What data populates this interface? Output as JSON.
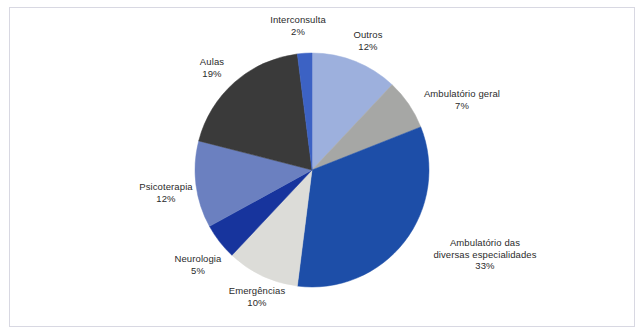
{
  "figure": {
    "background_color": "#ffffff",
    "frame_color": "#d8d8e2",
    "label_color": "#2b2b2b"
  },
  "chart_data": {
    "type": "pie",
    "title": "",
    "subtitle": "",
    "xlabel": "",
    "ylabel": "",
    "legend_position": "none",
    "labels_position": "outside",
    "grid": false,
    "start_angle_deg": 0,
    "direction": "clockwise",
    "categories": [
      "Outros",
      "Ambulatório geral",
      "Ambulatório das diversas especialidades",
      "Emergências",
      "Neurologia",
      "Psicoterapia",
      "Aulas",
      "Interconsulta"
    ],
    "values": [
      12,
      7,
      33,
      10,
      5,
      12,
      19,
      2
    ],
    "value_labels": [
      "12%",
      "7%",
      "33%",
      "10%",
      "5%",
      "12%",
      "19%",
      "2%"
    ],
    "colors": [
      "#9db0dd",
      "#a6a7a5",
      "#1d4ea8",
      "#dcdcd8",
      "#17349d",
      "#6b80c0",
      "#3a3a3a",
      "#3c62c4"
    ],
    "total": 100,
    "units": "percent"
  },
  "slices": [
    {
      "name": "Outros",
      "percent_label": "12%",
      "value": 12,
      "color": "#9db0dd",
      "label_lines": [
        "Outros",
        "12%"
      ]
    },
    {
      "name": "Ambulatório geral",
      "percent_label": "7%",
      "value": 7,
      "color": "#a6a7a5",
      "label_lines": [
        "Ambulatório geral",
        "7%"
      ]
    },
    {
      "name": "Ambulatório das diversas especialidades",
      "percent_label": "33%",
      "value": 33,
      "color": "#1d4ea8",
      "label_lines": [
        "Ambulatório das",
        "diversas especialidades",
        "33%"
      ]
    },
    {
      "name": "Emergências",
      "percent_label": "10%",
      "value": 10,
      "color": "#dcdcd8",
      "label_lines": [
        "Emergências",
        "10%"
      ]
    },
    {
      "name": "Neurologia",
      "percent_label": "5%",
      "value": 5,
      "color": "#17349d",
      "label_lines": [
        "Neurologia",
        "5%"
      ]
    },
    {
      "name": "Psicoterapia",
      "percent_label": "12%",
      "value": 12,
      "color": "#6b80c0",
      "label_lines": [
        "Psicoterapia",
        "12%"
      ]
    },
    {
      "name": "Aulas",
      "percent_label": "19%",
      "value": 19,
      "color": "#3a3a3a",
      "label_lines": [
        "Aulas",
        "19%"
      ]
    },
    {
      "name": "Interconsulta",
      "percent_label": "2%",
      "value": 2,
      "color": "#3c62c4",
      "label_lines": [
        "Interconsulta",
        "2%"
      ]
    }
  ],
  "labels": {
    "interconsulta_name": "Interconsulta",
    "interconsulta_pct": "2%",
    "outros_name": "Outros",
    "outros_pct": "12%",
    "ambulatorio_geral_name": "Ambulatório geral",
    "ambulatorio_geral_pct": "7%",
    "ambulatorio_esp_line1": "Ambulatório das",
    "ambulatorio_esp_line2": "diversas especialidades",
    "ambulatorio_esp_pct": "33%",
    "emergencias_name": "Emergências",
    "emergencias_pct": "10%",
    "neurologia_name": "Neurologia",
    "neurologia_pct": "5%",
    "psicoterapia_name": "Psicoterapia",
    "psicoterapia_pct": "12%",
    "aulas_name": "Aulas",
    "aulas_pct": "19%"
  }
}
